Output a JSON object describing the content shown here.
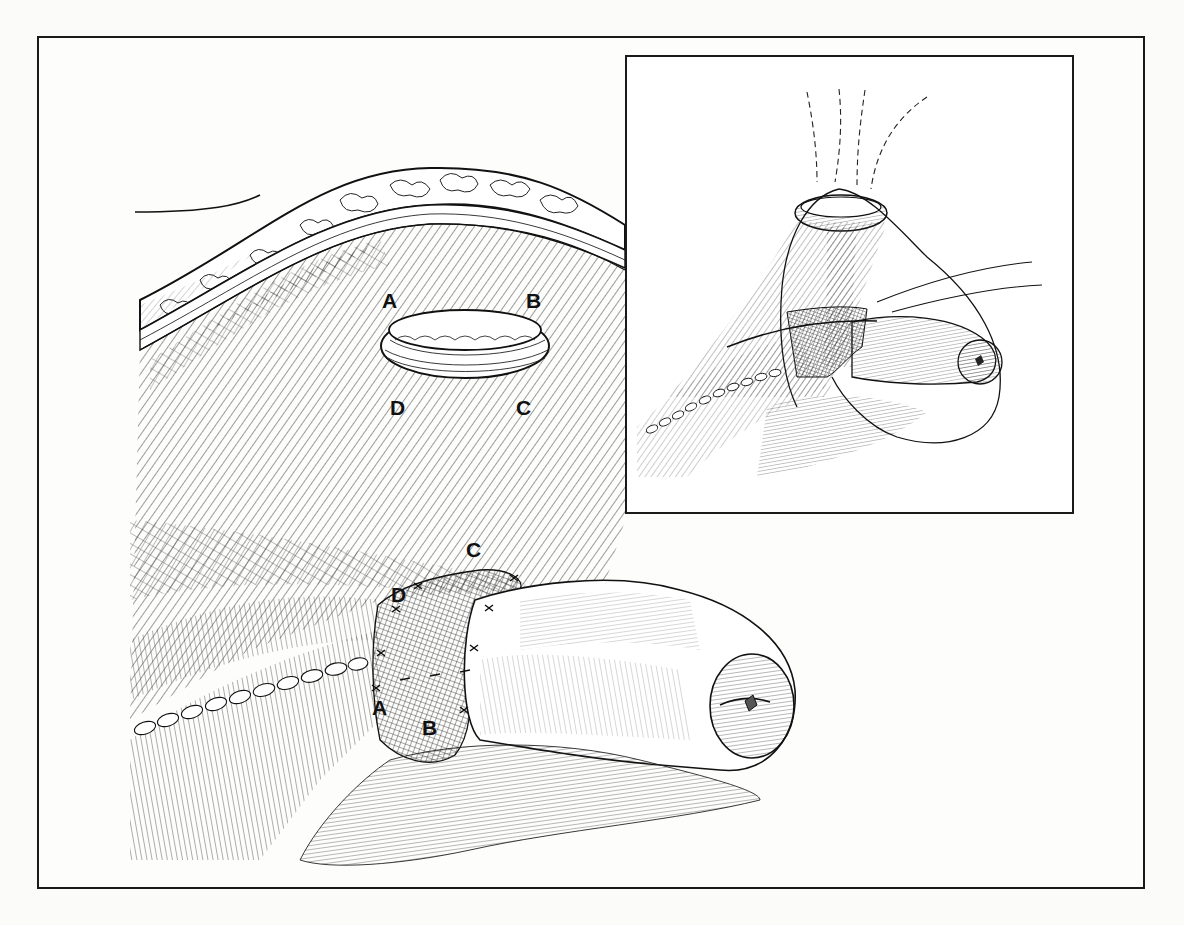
{
  "figure": {
    "type": "surgical line illustration",
    "colors": {
      "ink": "#111111",
      "paper": "#fdfdfc",
      "frame": "#1a1a1a"
    }
  },
  "main_panel": {
    "aperture_labels": [
      {
        "id": "A",
        "text": "A"
      },
      {
        "id": "B",
        "text": "B"
      },
      {
        "id": "C",
        "text": "C"
      },
      {
        "id": "D",
        "text": "D"
      }
    ],
    "mesh_labels": [
      {
        "id": "C",
        "text": "C"
      },
      {
        "id": "D",
        "text": "D"
      },
      {
        "id": "A",
        "text": "A"
      },
      {
        "id": "B",
        "text": "B"
      }
    ]
  },
  "inset_panel": {
    "description": "inset showing sutures drawn through the aperture"
  }
}
